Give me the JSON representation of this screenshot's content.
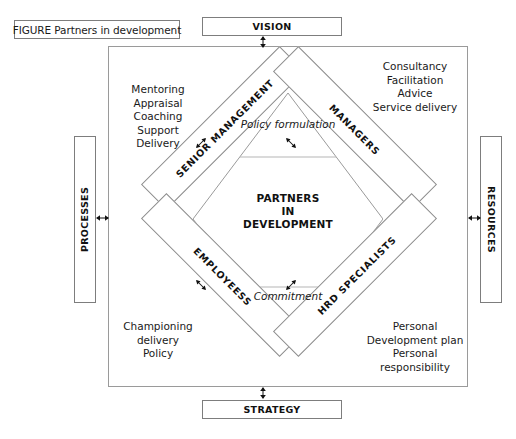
{
  "figure": {
    "caption": "FIGURE Partners in development"
  },
  "center": {
    "title": "PARTNERS\nIN\nDEVELOPMENT",
    "top_caption": "Policy\nformulation",
    "bottom_caption": "Commitment"
  },
  "bars": [
    {
      "id": "senior-management",
      "label": "SENIOR MANAGEMENT"
    },
    {
      "id": "managers",
      "label": "MANAGERS"
    },
    {
      "id": "employees",
      "label": "EMPLOYEESS"
    },
    {
      "id": "hrd-specialists",
      "label": "HRD SPECIALISTS"
    }
  ],
  "corners": {
    "top_left": "Mentoring\nAppraisal\nCoaching\nSupport\nDelivery",
    "top_right": "Consultancy\nFacilitation\nAdvice\nService delivery",
    "bottom_left": "Championing\ndelivery\nPolicy",
    "bottom_right": "Personal\nDevelopment plan\nPersonal\nresponsibility"
  },
  "external_boxes": {
    "vision": "VISION",
    "strategy": "STRATEGY",
    "processes": "PROCESSES",
    "resources": "RESOURCES"
  },
  "colors": {
    "stroke": "#8d8d8d",
    "box_stroke": "#7d7d7d",
    "frame_stroke": "#9a9a9a",
    "text": "#1a1a1a",
    "background": "#ffffff"
  }
}
